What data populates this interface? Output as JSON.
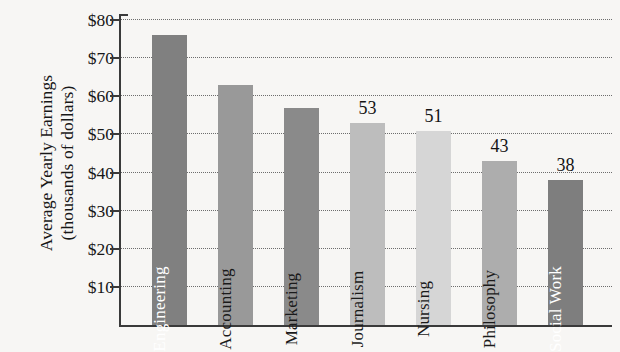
{
  "chart_data": {
    "type": "bar",
    "title": "",
    "xlabel": "",
    "ylabel": "Average Yearly Earnings (thousands of dollars)",
    "ylabel_lines": [
      "Average Yearly Earnings",
      "(thousands of dollars)"
    ],
    "categories": [
      "Engineering",
      "Accounting",
      "Marketing",
      "Journalism",
      "Nursing",
      "Philosophy",
      "Social Work"
    ],
    "values": [
      76,
      63,
      57,
      53,
      51,
      43,
      38
    ],
    "value_labels_shown": [
      "",
      "",
      "",
      "53",
      "51",
      "43",
      "38"
    ],
    "ylim": [
      0,
      82
    ],
    "ytick_values": [
      10,
      20,
      30,
      40,
      50,
      60,
      70,
      80
    ],
    "ytick_labels": [
      "$10",
      "$20",
      "$30",
      "$40",
      "$50",
      "$60",
      "$70",
      "$80"
    ],
    "grid": true,
    "grid_style": "dotted-horizontal",
    "legend": "none",
    "bar_colors": [
      "#808080",
      "#999999",
      "#8a8a8a",
      "#bdbdbd",
      "#d6d6d6",
      "#adadad",
      "#7e7e7e"
    ],
    "bar_label_colors": [
      "#ffffff",
      "#1a1a1a",
      "#1a1a1a",
      "#1a1a1a",
      "#1a1a1a",
      "#1a1a1a",
      "#ffffff"
    ]
  },
  "colors": {
    "background": "#f7f6f4",
    "axis": "#3a3a3a",
    "gridline": "#6d6d6d",
    "text": "#171717"
  }
}
